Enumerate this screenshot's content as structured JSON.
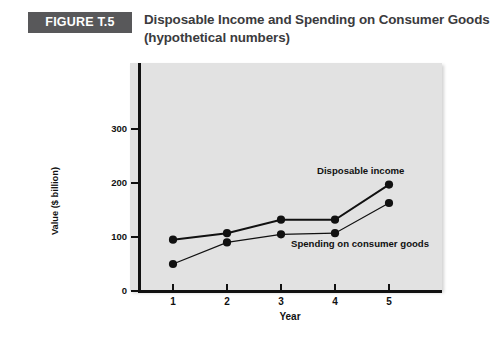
{
  "figure": {
    "badge_label": "FIGURE T.5",
    "title_line_1": "Disposable Income and Spending on Consumer Goods",
    "title_line_2": "(hypothetical numbers)",
    "badge_bg": "#58585a",
    "title_color": "#3b3b3d",
    "plot_bg": "#e2e2e2"
  },
  "chart_data": {
    "type": "line",
    "title": "Disposable Income and Spending on Consumer Goods (hypothetical numbers)",
    "xlabel": "Year",
    "ylabel": "Value ($ billion)",
    "categories": [
      "1",
      "2",
      "3",
      "4",
      "5"
    ],
    "x": [
      1,
      2,
      3,
      4,
      5
    ],
    "xlim": [
      0.6,
      5.6
    ],
    "ylim": [
      0,
      380
    ],
    "yticks": [
      "0",
      "100",
      "200",
      "300"
    ],
    "ytick_values": [
      0,
      100,
      200,
      300
    ],
    "grid": false,
    "legend": "annotations",
    "series": [
      {
        "name": "Disposable income",
        "values": [
          95,
          107,
          132,
          132,
          197
        ],
        "color": "#111111",
        "marker": "circle"
      },
      {
        "name": "Spending on consumer goods",
        "values": [
          50,
          90,
          105,
          107,
          163
        ],
        "color": "#111111",
        "marker": "circle"
      }
    ],
    "annotations": [
      {
        "text": "Disposable income",
        "series": "Disposable income"
      },
      {
        "text": "Spending on consumer goods",
        "series": "Spending on consumer goods"
      }
    ]
  }
}
